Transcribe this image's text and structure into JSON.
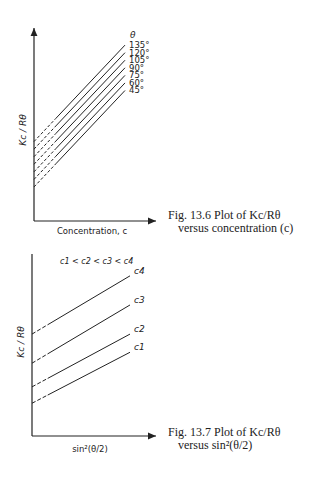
{
  "chart_data": [
    {
      "type": "line",
      "title": "Fig. 13.6 Plot of Kc/Rθ versus concentration (c)",
      "xlabel": "Concentration, c",
      "ylabel": "Kc / Rθ",
      "legend_title": "θ",
      "series": [
        {
          "name": "135°",
          "x": [
            0,
            1
          ],
          "y": [
            0.42,
            0.93
          ]
        },
        {
          "name": "120°",
          "x": [
            0,
            1
          ],
          "y": [
            0.38,
            0.89
          ]
        },
        {
          "name": "105°",
          "x": [
            0,
            1
          ],
          "y": [
            0.34,
            0.85
          ]
        },
        {
          "name": "90°",
          "x": [
            0,
            1
          ],
          "y": [
            0.3,
            0.81
          ]
        },
        {
          "name": "75°",
          "x": [
            0,
            1
          ],
          "y": [
            0.26,
            0.77
          ]
        },
        {
          "name": "60°",
          "x": [
            0,
            1
          ],
          "y": [
            0.22,
            0.73
          ]
        },
        {
          "name": "45°",
          "x": [
            0,
            1
          ],
          "y": [
            0.18,
            0.69
          ]
        }
      ],
      "notes": "Dashed extrapolation to c = 0; no numeric tick labels"
    },
    {
      "type": "line",
      "title": "Fig. 13.7 Plot of Kc/Rθ versus sin²(θ/2)",
      "xlabel": "sin²(θ/2)",
      "ylabel": "Kc / Rθ",
      "annotation": "c1 < c2 < c3 < c4",
      "series": [
        {
          "name": "c4",
          "x": [
            0,
            1
          ],
          "y": [
            0.56,
            0.88
          ]
        },
        {
          "name": "c3",
          "x": [
            0,
            1
          ],
          "y": [
            0.4,
            0.72
          ]
        },
        {
          "name": "c2",
          "x": [
            0,
            1
          ],
          "y": [
            0.27,
            0.56
          ]
        },
        {
          "name": "c1",
          "x": [
            0,
            1
          ],
          "y": [
            0.18,
            0.46
          ]
        }
      ],
      "notes": "Dashed extrapolation to sin²(θ/2) = 0; no numeric tick labels"
    }
  ],
  "fig1": {
    "caption_line1": "Fig. 13.6 Plot of Kc/Rθ",
    "caption_line2": "versus concentration (c)",
    "xlabel": "Concentration, c",
    "ylabel": "Kc / Rθ",
    "legend_title": "θ",
    "angles": [
      "135°",
      "120°",
      "105°",
      "90°",
      "75°",
      "60°",
      "45°"
    ]
  },
  "fig2": {
    "caption_line1": "Fig. 13.7 Plot of Kc/Rθ",
    "caption_line2": "versus sin²(θ/2)",
    "xlabel": "sin²(θ/2)",
    "ylabel": "Kc / Rθ",
    "annotation": "c1 < c2 < c3 < c4",
    "labels": [
      "c4",
      "c3",
      "c2",
      "c1"
    ]
  }
}
